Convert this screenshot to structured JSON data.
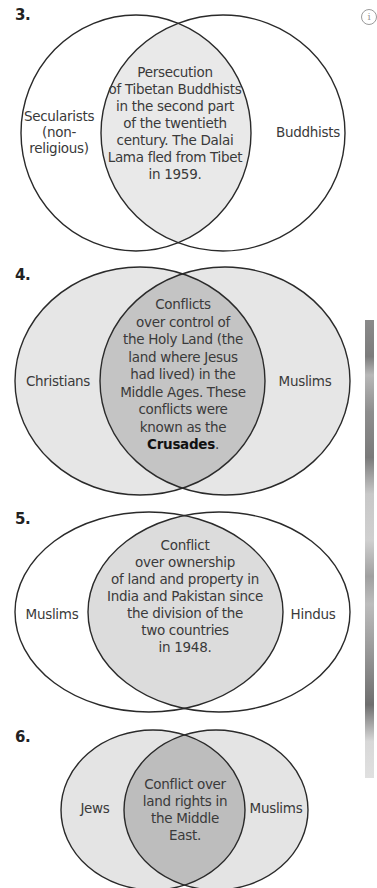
{
  "colors": {
    "stroke": "#2a2a2a",
    "white_fill": "#ffffff",
    "light_fill": "#e6e6e6",
    "light_overlap": "#e9e9e9",
    "dark_overlap": "#c2c2c2",
    "text": "#3a3a3a"
  },
  "info_icon": "circled-i-icon",
  "diagrams": [
    {
      "number": "3.",
      "left_label": [
        "Secularists",
        "(non-",
        "religious)"
      ],
      "right_label": "Buddhists",
      "overlap_text": [
        "Persecution",
        "of Tibetan Buddhists",
        "in the second part",
        "of the twentieth",
        "century. The Dalai",
        "Lama fled from Tibet",
        "in 1959."
      ]
    },
    {
      "number": "4.",
      "left_label": "Christians",
      "right_label": "Muslims",
      "overlap_text": [
        "Conflicts",
        "over control of",
        "the Holy Land (the",
        "land where Jesus",
        "had lived) in the",
        "Middle Ages. These",
        "conflicts were",
        "known as the"
      ],
      "overlap_bold": "Crusades",
      "overlap_tail": "."
    },
    {
      "number": "5.",
      "left_label": "Muslims",
      "right_label": "Hindus",
      "overlap_text": [
        "Conflict",
        "over ownership",
        "of land and property in",
        "India and Pakistan since",
        "the division of the",
        "two countries",
        "in 1948."
      ]
    },
    {
      "number": "6.",
      "left_label": "Jews",
      "right_label": "Muslims",
      "overlap_text": [
        "Conflict over",
        "land rights in",
        "the Middle",
        "East."
      ]
    }
  ]
}
